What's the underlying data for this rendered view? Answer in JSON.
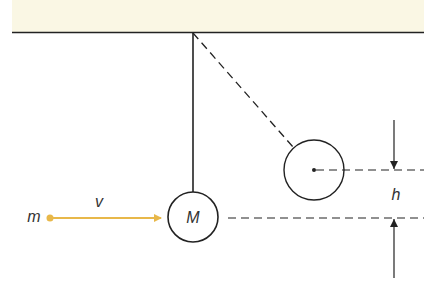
{
  "diagram": {
    "labels": {
      "projectile_mass": "m",
      "velocity": "v",
      "pendulum_mass": "M",
      "height": "h"
    },
    "colors": {
      "ceiling": "#faf7e4",
      "line": "#222222",
      "projectile": "#e8b84a"
    }
  }
}
